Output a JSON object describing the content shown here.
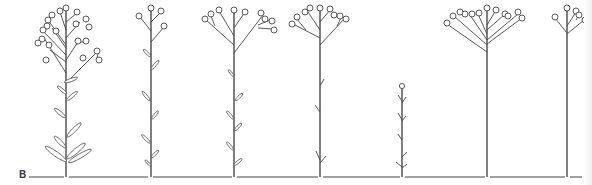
{
  "figure": {
    "panel_label": "B",
    "colors": {
      "ink": "#3a3a3a",
      "background": "#ffffff"
    },
    "plants": [
      {
        "index": 1,
        "x": 66,
        "top": 8,
        "form": "tall, densely branched corymb with many heads, leafy stem with basal leaves"
      },
      {
        "index": 2,
        "x": 150,
        "top": 8,
        "form": "slender stem, few heads, alternate narrow leaves"
      },
      {
        "index": 3,
        "x": 234,
        "top": 8,
        "form": "broad branched inflorescence, small leaves along stem"
      },
      {
        "index": 4,
        "x": 320,
        "top": 8,
        "form": "branched inflorescence, sparse reduced leaves"
      },
      {
        "index": 5,
        "x": 402,
        "top": 86,
        "form": "short single-headed stem with small leaves"
      },
      {
        "index": 6,
        "x": 487,
        "top": 8,
        "form": "tall leafless stem with wide flat-topped inflorescence"
      },
      {
        "index": 7,
        "x": 567,
        "top": 8,
        "form": "tall leafless stem with small inflorescence"
      }
    ]
  }
}
